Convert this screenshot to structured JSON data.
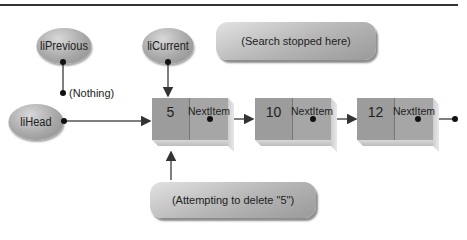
{
  "diagram": {
    "pointers": {
      "liPrevious": "liPrevious",
      "liCurrent": "liCurrent",
      "liHead": "liHead"
    },
    "nothing_label": "(Nothing)",
    "callouts": {
      "search_stopped": "(Search stopped here)",
      "attempting_delete": "(Attempting to delete \"5\")"
    },
    "nodes": [
      {
        "value": "5",
        "pointer_label": "NextItem"
      },
      {
        "value": "10",
        "pointer_label": "NextItem"
      },
      {
        "value": "12",
        "pointer_label": "NextItem"
      }
    ],
    "colors": {
      "node_face": "#9c9c9c",
      "node_pointer": "#a6a6a6",
      "oval": "#a8a8a8",
      "line": "#333333"
    }
  }
}
